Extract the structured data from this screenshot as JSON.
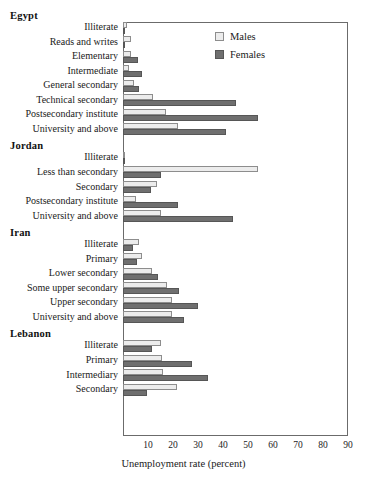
{
  "chart_data": {
    "type": "bar",
    "orientation": "horizontal",
    "title": "",
    "xlabel": "Unemployment rate (percent)",
    "ylabel": "",
    "xlim": [
      0,
      95
    ],
    "xticks": [
      10,
      20,
      30,
      40,
      50,
      60,
      70,
      80,
      90
    ],
    "grid": false,
    "legend": {
      "position": "top-right",
      "entries": [
        {
          "name": "Males",
          "color": "#ececec"
        },
        {
          "name": "Females",
          "color": "#6f6f6f"
        }
      ]
    },
    "groups": [
      {
        "name": "Egypt",
        "categories": [
          "Illiterate",
          "Reads and writes",
          "Elementary",
          "Intermediate",
          "General secondary",
          "Technical secondary",
          "Postsecondary institute",
          "University and above"
        ],
        "series": [
          {
            "name": "Males",
            "values": [
              1.5,
              3.0,
              3.0,
              2.5,
              4.5,
              12.0,
              17.0,
              22.0
            ]
          },
          {
            "name": "Females",
            "values": [
              0.5,
              0.5,
              6.0,
              7.5,
              6.5,
              45.0,
              54.0,
              41.0
            ]
          }
        ]
      },
      {
        "name": "Jordan",
        "categories": [
          "Illiterate",
          "Less than secondary",
          "Secondary",
          "Postsecondary institute",
          "University and above"
        ],
        "series": [
          {
            "name": "Males",
            "values": [
              0.8,
              54.0,
              13.5,
              5.0,
              15.0
            ]
          },
          {
            "name": "Females",
            "values": [
              0.3,
              15.0,
              11.0,
              22.0,
              44.0
            ]
          }
        ]
      },
      {
        "name": "Iran",
        "categories": [
          "Illiterate",
          "Primary",
          "Lower secondary",
          "Some upper secondary",
          "Upper secondary",
          "University and above"
        ],
        "series": [
          {
            "name": "Males",
            "values": [
              6.5,
              7.5,
              11.5,
              17.5,
              19.5,
              19.5
            ]
          },
          {
            "name": "Females",
            "values": [
              4.0,
              5.5,
              14.0,
              22.5,
              30.0,
              24.5
            ]
          }
        ]
      },
      {
        "name": "Lebanon",
        "categories": [
          "Illiterate",
          "Primary",
          "Intermediary",
          "Secondary"
        ],
        "series": [
          {
            "name": "Males",
            "values": [
              15.0,
              15.5,
              16.0,
              21.5
            ]
          },
          {
            "name": "Females",
            "values": [
              11.5,
              27.5,
              34.0,
              9.5
            ]
          }
        ]
      }
    ]
  }
}
